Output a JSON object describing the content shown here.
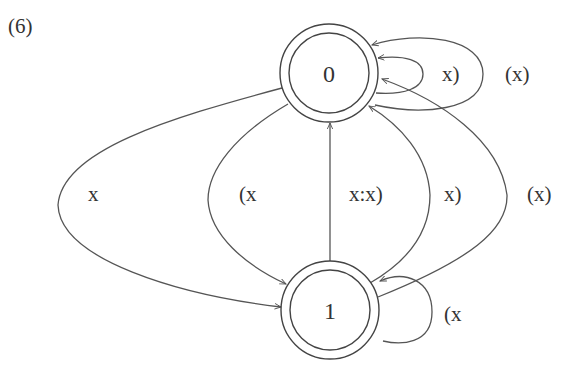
{
  "figure": {
    "number_label": "(6)"
  },
  "nodes": [
    {
      "id": "0",
      "label": "0",
      "cx": 329,
      "cy": 73,
      "accepting": true
    },
    {
      "id": "1",
      "label": "1",
      "cx": 330,
      "cy": 310,
      "accepting": true
    }
  ],
  "edges": [
    {
      "from": "0",
      "to": "1",
      "label": "x"
    },
    {
      "from": "0",
      "to": "1",
      "label": "(x"
    },
    {
      "from": "1",
      "to": "0",
      "label": "x:x)"
    },
    {
      "from": "1",
      "to": "0",
      "label": "x)"
    },
    {
      "from": "1",
      "to": "0",
      "label": "(x)"
    },
    {
      "from": "0",
      "to": "0",
      "label": "x)"
    },
    {
      "from": "0",
      "to": "0",
      "label": "(x)"
    },
    {
      "from": "1",
      "to": "1",
      "label": "(x"
    }
  ],
  "colors": {
    "stroke": "#555555",
    "text": "#333333",
    "background": "#ffffff"
  }
}
